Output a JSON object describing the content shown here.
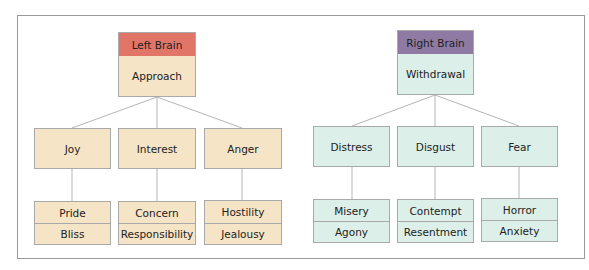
{
  "left": {
    "header": "Left Brain",
    "root": "Approach",
    "colors": {
      "header": "#e17668",
      "fill": "#f5e4c6"
    },
    "branches": [
      {
        "label": "Joy",
        "children": [
          "Pride",
          "Bliss"
        ]
      },
      {
        "label": "Interest",
        "children": [
          "Concern",
          "Responsibility"
        ]
      },
      {
        "label": "Anger",
        "children": [
          "Hostility",
          "Jealousy"
        ]
      }
    ]
  },
  "right": {
    "header": "Right Brain",
    "root": "Withdrawal",
    "colors": {
      "header": "#8e7aa3",
      "fill": "#dcefe8"
    },
    "branches": [
      {
        "label": "Distress",
        "children": [
          "Misery",
          "Agony"
        ]
      },
      {
        "label": "Disgust",
        "children": [
          "Contempt",
          "Resentment"
        ]
      },
      {
        "label": "Fear",
        "children": [
          "Horror",
          "Anxiety"
        ]
      }
    ]
  }
}
